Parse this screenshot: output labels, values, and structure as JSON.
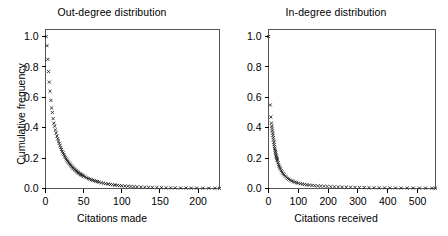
{
  "figure": {
    "background_color": "#ffffff",
    "marker_symbol": "x",
    "marker_color": "#1c1c1c"
  },
  "panels": [
    {
      "id": "out-degree",
      "title": "Out-degree distribution",
      "xlabel": "Citations made",
      "ylabel": "Cumulative frequency",
      "xticks": [
        "0",
        "50",
        "100",
        "150",
        "200"
      ],
      "yticks": [
        "1.0",
        "0.8",
        "0.6",
        "0.4",
        "0.2",
        "0.0"
      ]
    },
    {
      "id": "in-degree",
      "title": "In-degree distribution",
      "xlabel": "Citations received",
      "ylabel": "Cumulative frequency",
      "xticks": [
        "0",
        "100",
        "200",
        "300",
        "400",
        "500"
      ],
      "yticks": [
        "1.0",
        "0.8",
        "0.6",
        "0.4",
        "0.2",
        "0.0"
      ]
    }
  ],
  "chart_data": [
    {
      "type": "scatter",
      "title": "Out-degree distribution",
      "xlabel": "Citations made",
      "ylabel": "Cumulative frequency",
      "xlim": [
        0,
        228
      ],
      "ylim": [
        0.0,
        1.04
      ],
      "xticks": [
        0,
        50,
        100,
        150,
        200
      ],
      "yticks": [
        0.0,
        0.2,
        0.4,
        0.6,
        0.8,
        1.0
      ],
      "grid": false,
      "legend": null,
      "marker": "x",
      "series": [
        {
          "name": "Out-degree cumulative frequency",
          "x": [
            1,
            2,
            3,
            4,
            5,
            6,
            7,
            8,
            9,
            10,
            11,
            12,
            13,
            14,
            15,
            16,
            17,
            18,
            19,
            20,
            21,
            22,
            23,
            24,
            25,
            26,
            27,
            28,
            29,
            30,
            31,
            32,
            33,
            34,
            35,
            36,
            37,
            38,
            39,
            40,
            41,
            42,
            43,
            44,
            45,
            46,
            47,
            48,
            49,
            50,
            52,
            54,
            56,
            58,
            60,
            62,
            64,
            66,
            68,
            70,
            73,
            76,
            79,
            82,
            85,
            88,
            91,
            94,
            97,
            100,
            104,
            108,
            112,
            116,
            120,
            125,
            130,
            135,
            140,
            146,
            152,
            158,
            164,
            170,
            177,
            184,
            191,
            198,
            206,
            214,
            222,
            228
          ],
          "y": [
            1.0,
            0.94,
            0.85,
            0.77,
            0.7,
            0.64,
            0.58,
            0.53,
            0.5,
            0.46,
            0.43,
            0.41,
            0.385,
            0.365,
            0.345,
            0.328,
            0.312,
            0.297,
            0.283,
            0.27,
            0.257,
            0.245,
            0.234,
            0.224,
            0.214,
            0.205,
            0.196,
            0.188,
            0.18,
            0.173,
            0.166,
            0.159,
            0.153,
            0.147,
            0.141,
            0.136,
            0.131,
            0.126,
            0.121,
            0.117,
            0.112,
            0.108,
            0.104,
            0.1,
            0.097,
            0.093,
            0.09,
            0.087,
            0.084,
            0.081,
            0.076,
            0.071,
            0.066,
            0.062,
            0.058,
            0.054,
            0.051,
            0.048,
            0.045,
            0.042,
            0.038,
            0.035,
            0.032,
            0.029,
            0.027,
            0.025,
            0.023,
            0.021,
            0.019,
            0.018,
            0.016,
            0.015,
            0.0135,
            0.0122,
            0.011,
            0.0098,
            0.0088,
            0.0079,
            0.0071,
            0.0063,
            0.0056,
            0.005,
            0.0045,
            0.004,
            0.0035,
            0.0031,
            0.0027,
            0.0024,
            0.002,
            0.0017,
            0.0014,
            0.001
          ]
        }
      ]
    },
    {
      "type": "scatter",
      "title": "In-degree distribution",
      "xlabel": "Citations received",
      "ylabel": "Cumulative frequency",
      "xlim": [
        0,
        560
      ],
      "ylim": [
        0.0,
        1.04
      ],
      "xticks": [
        0,
        100,
        200,
        300,
        400,
        500
      ],
      "yticks": [
        0.0,
        0.2,
        0.4,
        0.6,
        0.8,
        1.0
      ],
      "grid": false,
      "legend": null,
      "marker": "x",
      "series": [
        {
          "name": "In-degree cumulative frequency",
          "x": [
            0,
            6,
            8,
            10,
            11,
            12,
            13,
            14,
            15,
            16,
            17,
            18,
            19,
            20,
            21,
            22,
            23,
            24,
            25,
            26,
            27,
            28,
            29,
            30,
            32,
            34,
            36,
            38,
            40,
            43,
            46,
            49,
            52,
            56,
            60,
            64,
            68,
            73,
            78,
            83,
            88,
            94,
            100,
            107,
            114,
            121,
            129,
            137,
            146,
            155,
            165,
            175,
            186,
            197,
            209,
            221,
            234,
            247,
            261,
            275,
            290,
            305,
            321,
            337,
            354,
            371,
            389,
            407,
            426,
            445,
            465,
            485,
            506,
            527,
            548,
            560
          ],
          "y": [
            1.0,
            0.55,
            0.47,
            0.43,
            0.41,
            0.395,
            0.38,
            0.365,
            0.35,
            0.335,
            0.32,
            0.305,
            0.29,
            0.277,
            0.265,
            0.253,
            0.242,
            0.232,
            0.222,
            0.213,
            0.205,
            0.197,
            0.189,
            0.182,
            0.169,
            0.157,
            0.147,
            0.137,
            0.128,
            0.117,
            0.107,
            0.098,
            0.09,
            0.081,
            0.074,
            0.067,
            0.061,
            0.055,
            0.05,
            0.046,
            0.042,
            0.038,
            0.035,
            0.032,
            0.029,
            0.027,
            0.0245,
            0.0225,
            0.0205,
            0.0188,
            0.0172,
            0.0158,
            0.0145,
            0.0133,
            0.0122,
            0.0112,
            0.0103,
            0.0095,
            0.0088,
            0.0081,
            0.0074,
            0.0068,
            0.0062,
            0.0057,
            0.0052,
            0.0048,
            0.0044,
            0.004,
            0.0036,
            0.0033,
            0.003,
            0.0027,
            0.0024,
            0.0021,
            0.0018,
            0.0015
          ]
        }
      ]
    }
  ]
}
